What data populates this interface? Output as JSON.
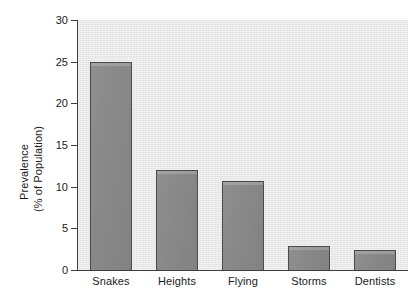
{
  "chart_data": {
    "type": "bar",
    "title": "",
    "xlabel": "",
    "ylabel": "Prevalence (% of Population)",
    "ylabel_lines": [
      "Prevalence",
      "(% of Population)"
    ],
    "categories": [
      "Snakes",
      "Heights",
      "Flying",
      "Storms",
      "Dentists"
    ],
    "values": [
      25.0,
      12.0,
      10.7,
      2.9,
      2.4
    ],
    "ylim": [
      0,
      30
    ],
    "ytick_values": [
      0,
      5,
      10,
      15,
      20,
      25,
      30
    ],
    "ytick_labels": [
      "0",
      "5",
      "10",
      "15",
      "20",
      "25",
      "30"
    ],
    "grid": false,
    "legend": false,
    "colors": {
      "bar_fill": "#8a8a8a",
      "bar_edge": "#4a4a4a",
      "plot_background": "#e9e9e9",
      "figure_background": "#ffffff",
      "axis": "#3d3d3d",
      "text": "#1a1a1a"
    }
  }
}
